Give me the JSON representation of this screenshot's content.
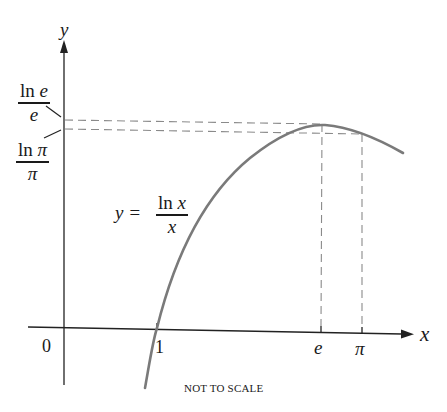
{
  "diagram": {
    "axes": {
      "x_label": "x",
      "y_label": "y",
      "origin_label": "0"
    },
    "x_ticks": [
      {
        "label": "1",
        "italic": false
      },
      {
        "label": "e",
        "italic": true
      },
      {
        "label": "π",
        "italic": true
      }
    ],
    "y_markers": [
      {
        "numerator": "ln e",
        "denominator": "e"
      },
      {
        "numerator": "ln π",
        "denominator": "π"
      }
    ],
    "curve": {
      "equation_lhs": "y =",
      "equation_numerator": "ln x",
      "equation_denominator": "x",
      "color": "#7a7a7a"
    },
    "guide_lines": {
      "style": "dashed",
      "color": "#8a8a8a"
    },
    "note": "NOT TO SCALE"
  }
}
